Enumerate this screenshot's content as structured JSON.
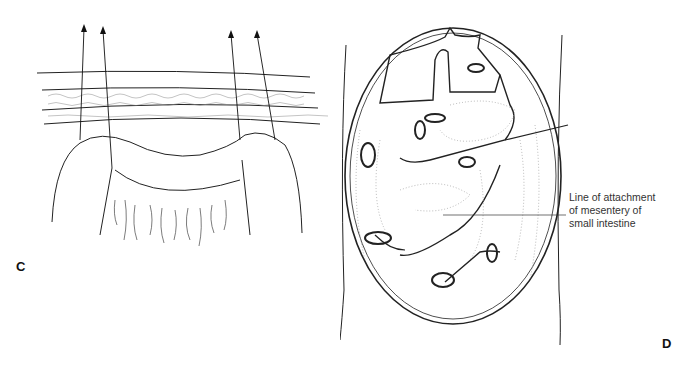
{
  "figure": {
    "panels": [
      {
        "id": "C",
        "label": "C",
        "description": "Surgical incision with sutures through abdominal wall layers"
      },
      {
        "id": "D",
        "label": "D",
        "description": "Peritoneal cavity with mesenteric attachments"
      }
    ],
    "annotation": {
      "lines": [
        "Line of attachment",
        "of mesentery of",
        "small intestine"
      ]
    }
  }
}
